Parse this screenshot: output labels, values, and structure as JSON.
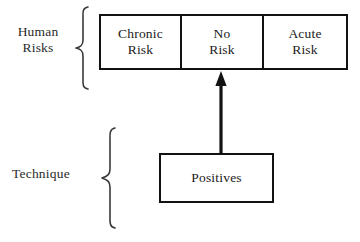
{
  "diagram": {
    "background_color": "#ffffff",
    "stroke_color": "#121212",
    "text_color": "#1a1a1a",
    "groups": [
      {
        "id": "human-risks",
        "label": "Human\nRisks",
        "brace_name": "curly-brace-icon"
      },
      {
        "id": "technique",
        "label": "Technique",
        "brace_name": "curly-brace-icon"
      }
    ],
    "risk_row": {
      "name": "risk-category-row",
      "cells": [
        {
          "id": "chronic-risk",
          "label": "Chronic\nRisk"
        },
        {
          "id": "no-risk",
          "label": "No\nRisk"
        },
        {
          "id": "acute-risk",
          "label": "Acute\nRisk"
        }
      ]
    },
    "technique_box": {
      "id": "positives",
      "label": "Positives"
    },
    "connector": {
      "name": "upward-arrow-icon",
      "from": "positives",
      "to": "no-risk",
      "direction": "up"
    }
  }
}
